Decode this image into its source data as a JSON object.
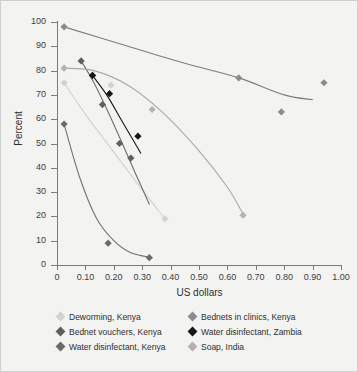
{
  "chart_data": {
    "type": "scatter",
    "title": "",
    "xlabel": "US dollars",
    "ylabel": "Percent",
    "xlim": [
      0,
      1.0
    ],
    "ylim": [
      0,
      100
    ],
    "xticks": [
      "0",
      "0.10",
      "0.20",
      "0.30",
      "0.40",
      "0.50",
      "0.60",
      "0.70",
      "0.80",
      "0.90",
      "1.00"
    ],
    "xtick_values": [
      0,
      0.1,
      0.2,
      0.3,
      0.4,
      0.5,
      0.6,
      0.7,
      0.8,
      0.9,
      1.0
    ],
    "yticks": [
      "0",
      "10",
      "20",
      "30",
      "40",
      "50",
      "60",
      "70",
      "80",
      "90",
      "100"
    ],
    "ytick_values": [
      0,
      10,
      20,
      30,
      40,
      50,
      60,
      70,
      80,
      90,
      100
    ],
    "grid": false,
    "legend_position": "bottom",
    "series": [
      {
        "name": "Deworming, Kenya",
        "color": "#d2d2d2",
        "line_color": "#d2d2d2",
        "points": [
          {
            "x": 0.025,
            "y": 75
          },
          {
            "x": 0.19,
            "y": 74
          },
          {
            "x": 0.38,
            "y": 19
          }
        ],
        "curve": [
          {
            "x": 0.025,
            "y": 75
          },
          {
            "x": 0.1,
            "y": 62
          },
          {
            "x": 0.19,
            "y": 48
          },
          {
            "x": 0.28,
            "y": 34
          },
          {
            "x": 0.38,
            "y": 19
          }
        ]
      },
      {
        "name": "Bednets in clinics, Kenya",
        "color": "#8b8b8b",
        "line_color": "#7d7d7d",
        "points": [
          {
            "x": 0.025,
            "y": 98
          },
          {
            "x": 0.64,
            "y": 77
          },
          {
            "x": 0.79,
            "y": 63
          },
          {
            "x": 0.94,
            "y": 75
          }
        ],
        "curve": [
          {
            "x": 0.025,
            "y": 98
          },
          {
            "x": 0.25,
            "y": 90
          },
          {
            "x": 0.45,
            "y": 83
          },
          {
            "x": 0.64,
            "y": 77
          },
          {
            "x": 0.8,
            "y": 70
          },
          {
            "x": 0.9,
            "y": 68
          }
        ]
      },
      {
        "name": "Bednet vouchers, Kenya",
        "color": "#5f5f5f",
        "line_color": "#6e6e6e",
        "points": [
          {
            "x": 0.085,
            "y": 84
          },
          {
            "x": 0.125,
            "y": 78
          },
          {
            "x": 0.16,
            "y": 66
          },
          {
            "x": 0.22,
            "y": 50
          },
          {
            "x": 0.26,
            "y": 44
          }
        ],
        "curve": [
          {
            "x": 0.085,
            "y": 84
          },
          {
            "x": 0.13,
            "y": 75
          },
          {
            "x": 0.18,
            "y": 63
          },
          {
            "x": 0.23,
            "y": 50
          },
          {
            "x": 0.275,
            "y": 38
          },
          {
            "x": 0.325,
            "y": 25
          }
        ]
      },
      {
        "name": "Water disinfectant, Zambia",
        "color": "#161616",
        "line_color": "#161616",
        "points": [
          {
            "x": 0.125,
            "y": 78
          },
          {
            "x": 0.185,
            "y": 70.5
          },
          {
            "x": 0.285,
            "y": 53
          }
        ],
        "curve": [
          {
            "x": 0.125,
            "y": 78
          },
          {
            "x": 0.175,
            "y": 70
          },
          {
            "x": 0.225,
            "y": 60
          },
          {
            "x": 0.27,
            "y": 51
          },
          {
            "x": 0.295,
            "y": 46
          }
        ]
      },
      {
        "name": "Water disinfectant, Kenya",
        "color": "#6b6b6b",
        "line_color": "#737373",
        "points": [
          {
            "x": 0.025,
            "y": 58
          },
          {
            "x": 0.18,
            "y": 9
          },
          {
            "x": 0.325,
            "y": 3
          }
        ],
        "curve": [
          {
            "x": 0.025,
            "y": 58
          },
          {
            "x": 0.08,
            "y": 36
          },
          {
            "x": 0.14,
            "y": 19
          },
          {
            "x": 0.2,
            "y": 10
          },
          {
            "x": 0.26,
            "y": 5
          },
          {
            "x": 0.335,
            "y": 3
          }
        ]
      },
      {
        "name": "Soap, India",
        "color": "#b3b3b3",
        "line_color": "#a9a9a9",
        "points": [
          {
            "x": 0.025,
            "y": 81
          },
          {
            "x": 0.335,
            "y": 64
          },
          {
            "x": 0.655,
            "y": 20.5
          }
        ],
        "curve": [
          {
            "x": 0.025,
            "y": 81
          },
          {
            "x": 0.13,
            "y": 80
          },
          {
            "x": 0.25,
            "y": 74
          },
          {
            "x": 0.37,
            "y": 63
          },
          {
            "x": 0.5,
            "y": 47
          },
          {
            "x": 0.6,
            "y": 32
          },
          {
            "x": 0.66,
            "y": 20
          }
        ]
      }
    ]
  },
  "axes": {
    "x_title": "US dollars",
    "y_title": "Percent"
  },
  "legend": {
    "rows": [
      [
        {
          "label": "Deworming, Kenya",
          "color": "#d2d2d2"
        },
        {
          "label": "Bednets in clinics, Kenya",
          "color": "#8b8b8b"
        }
      ],
      [
        {
          "label": "Bednet vouchers, Kenya",
          "color": "#5f5f5f"
        },
        {
          "label": "Water disinfectant, Zambia",
          "color": "#161616"
        }
      ],
      [
        {
          "label": "Water disinfectant, Kenya",
          "color": "#6b6b6b"
        },
        {
          "label": "Soap, India",
          "color": "#b3b3b3"
        }
      ]
    ]
  }
}
